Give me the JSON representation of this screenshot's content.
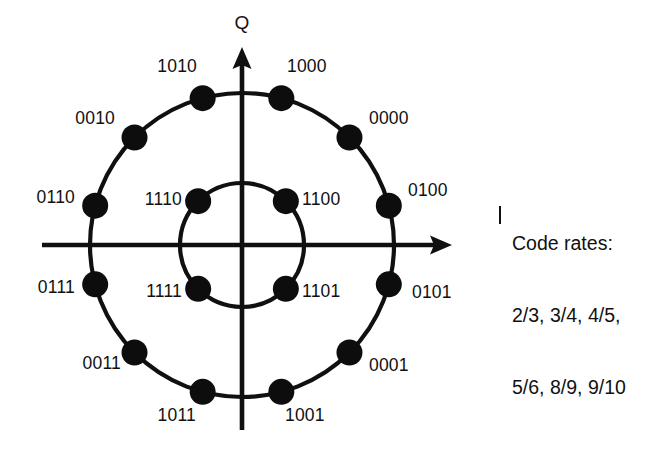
{
  "figure": {
    "background_color": "#ffffff",
    "ink_color": "#101010"
  },
  "axes": {
    "q_label": "Q",
    "i_label": "I",
    "center": {
      "x": 242,
      "y": 245
    },
    "horizontal": {
      "x_start": 42,
      "x_end": 452,
      "arrow": "right"
    },
    "vertical": {
      "y_start": 47,
      "y_end": 430,
      "arrow": "up"
    }
  },
  "chart_data": {
    "type": "scatter",
    "xlabel": "I",
    "ylabel": "Q",
    "grid": false,
    "legend": null,
    "coordinate_system": "polar",
    "rings": [
      {
        "name": "outer-ring",
        "radius_px": 152,
        "point_count": 12,
        "angle_offset_deg": 15,
        "angle_step_deg": 30,
        "points": [
          {
            "label": "0100",
            "angle_deg": 15,
            "label_x": 408,
            "label_y": 196,
            "anchor": "start"
          },
          {
            "label": "0000",
            "angle_deg": 45,
            "label_x": 369,
            "label_y": 124,
            "anchor": "start"
          },
          {
            "label": "1000",
            "angle_deg": 75,
            "label_x": 287,
            "label_y": 72,
            "anchor": "start"
          },
          {
            "label": "1010",
            "angle_deg": 105,
            "label_x": 197,
            "label_y": 72,
            "anchor": "end"
          },
          {
            "label": "0010",
            "angle_deg": 135,
            "label_x": 115,
            "label_y": 124,
            "anchor": "end"
          },
          {
            "label": "0110",
            "angle_deg": 165,
            "label_x": 75,
            "label_y": 203,
            "anchor": "end"
          },
          {
            "label": "0111",
            "angle_deg": 195,
            "label_x": 75,
            "label_y": 293,
            "anchor": "end"
          },
          {
            "label": "0011",
            "angle_deg": 225,
            "label_x": 121,
            "label_y": 369,
            "anchor": "end"
          },
          {
            "label": "1011",
            "angle_deg": 255,
            "label_x": 196,
            "label_y": 421,
            "anchor": "end"
          },
          {
            "label": "1001",
            "angle_deg": 285,
            "label_x": 285,
            "label_y": 421,
            "anchor": "start"
          },
          {
            "label": "0001",
            "angle_deg": 315,
            "label_x": 369,
            "label_y": 371,
            "anchor": "start"
          },
          {
            "label": "0101",
            "angle_deg": 345,
            "label_x": 412,
            "label_y": 298,
            "anchor": "start"
          }
        ]
      },
      {
        "name": "inner-ring",
        "radius_px": 62,
        "point_count": 4,
        "angle_offset_deg": 45,
        "angle_step_deg": 90,
        "points": [
          {
            "label": "1100",
            "angle_deg": 45,
            "label_x": 302,
            "label_y": 205,
            "anchor": "start"
          },
          {
            "label": "1110",
            "angle_deg": 135,
            "label_x": 182,
            "label_y": 205,
            "anchor": "end"
          },
          {
            "label": "1111",
            "angle_deg": 225,
            "label_x": 182,
            "label_y": 297,
            "anchor": "end"
          },
          {
            "label": "1101",
            "angle_deg": 315,
            "label_x": 302,
            "label_y": 297,
            "anchor": "start"
          }
        ]
      }
    ],
    "marker": {
      "shape": "circle",
      "radius_px": 13,
      "fill": "#0d0d0d"
    }
  },
  "side_note": {
    "bar_glyph": "|",
    "lines": [
      "Code rates:",
      "2/3, 3/4, 4/5,",
      "5/6, 8/9, 9/10"
    ]
  }
}
